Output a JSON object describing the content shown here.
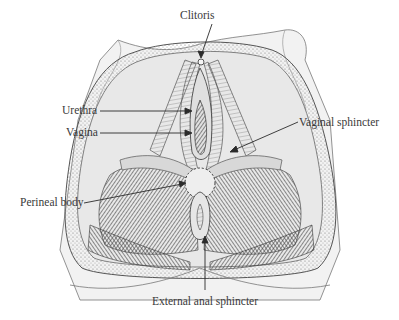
{
  "figure": {
    "labels": [
      {
        "id": "clitoris",
        "text": "Clitoris",
        "x": 180,
        "y": 10
      },
      {
        "id": "urethra",
        "text": "Urethra",
        "x": 62,
        "y": 97
      },
      {
        "id": "vagina",
        "text": "Vagina",
        "x": 66,
        "y": 118
      },
      {
        "id": "vaginal-sphincter",
        "text": "Vaginal sphincter",
        "x": 299,
        "y": 117
      },
      {
        "id": "perineal-body",
        "text": "Perineal body",
        "x": 20,
        "y": 196
      },
      {
        "id": "external-anal-sphincter",
        "text": "External anal sphincter",
        "x": 152,
        "y": 296
      }
    ],
    "muscle_inscriptions": [
      "Ischiocavernosus",
      "Bulbocavernosus",
      "Transversus perinei",
      "Levator ani",
      "Gluteus maximus"
    ],
    "colors": {
      "ink": "#2b2b2b",
      "label_text": "#3a3a3a",
      "shade_dark": "#3c3c3c",
      "shade_mid": "#8a8a8a",
      "shade_light": "#cfcfcf",
      "background": "#ffffff"
    }
  }
}
